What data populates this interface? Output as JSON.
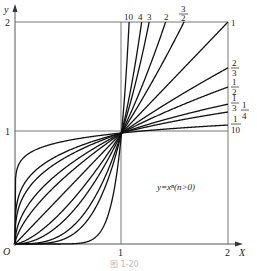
{
  "chart_data": {
    "type": "line",
    "annotation": "y=xⁿ(n>0)",
    "caption": "图 1-20",
    "xlabel": "X",
    "ylabel": "y",
    "origin_label": "O",
    "xlim": [
      0,
      2
    ],
    "ylim": [
      0,
      2
    ],
    "x_ticks": [
      "1",
      "2"
    ],
    "y_ticks": [
      "1",
      "2"
    ],
    "grid": false,
    "reference_lines": [
      {
        "type": "horizontal",
        "y": 1
      },
      {
        "type": "horizontal",
        "y": 2
      },
      {
        "type": "vertical",
        "x": 1
      },
      {
        "type": "vertical",
        "x": 2
      }
    ],
    "series": [
      {
        "name": "10",
        "n": 10
      },
      {
        "name": "4",
        "n": 4
      },
      {
        "name": "3",
        "n": 3
      },
      {
        "name": "2",
        "n": 2
      },
      {
        "name": "3/2",
        "n": 1.5
      },
      {
        "name": "1",
        "n": 1
      },
      {
        "name": "2/3",
        "n": 0.6667
      },
      {
        "name": "1/2",
        "n": 0.5
      },
      {
        "name": "1/3",
        "n": 0.3333
      },
      {
        "name": "1/4",
        "n": 0.25
      },
      {
        "name": "1/10",
        "n": 0.1
      }
    ],
    "common_points": [
      [
        0,
        0
      ],
      [
        1,
        1
      ]
    ]
  },
  "labels": {
    "top": [
      {
        "text": "10",
        "key": "n10"
      },
      {
        "text": "4",
        "key": "n4"
      },
      {
        "text": "3",
        "key": "n3"
      },
      {
        "text": "2",
        "key": "n2"
      },
      {
        "text": "3",
        "den": "2",
        "key": "n3_2"
      },
      {
        "text": "1",
        "key": "n1"
      }
    ],
    "right": [
      {
        "num": "2",
        "den": "3",
        "key": "n2_3"
      },
      {
        "num": "1",
        "den": "2",
        "key": "n1_2"
      },
      {
        "num": "1",
        "den": "3",
        "key": "n1_3"
      },
      {
        "num": "1",
        "den": "4",
        "key": "n1_4"
      },
      {
        "num": "1",
        "den": "10",
        "key": "n1_10"
      }
    ]
  }
}
